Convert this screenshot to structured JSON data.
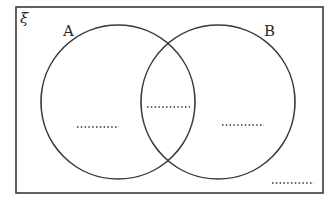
{
  "diagram": {
    "type": "venn",
    "universal_set_symbol": "ξ",
    "sets": [
      {
        "label": "A",
        "cx": 118,
        "cy": 102,
        "r": 77
      },
      {
        "label": "B",
        "cx": 218,
        "cy": 102,
        "r": 77
      }
    ],
    "regions": [
      {
        "name": "only-a",
        "value": "",
        "placeholder": "............",
        "x1": 77,
        "x2": 119,
        "y": 127
      },
      {
        "name": "a-intersect-b",
        "value": "",
        "placeholder": "............",
        "x1": 147,
        "x2": 190,
        "y": 107
      },
      {
        "name": "only-b",
        "value": "",
        "placeholder": "............",
        "x1": 222,
        "x2": 264,
        "y": 125
      },
      {
        "name": "outside",
        "value": "",
        "placeholder": "............",
        "x1": 272,
        "x2": 314,
        "y": 183
      }
    ],
    "colors": {
      "stroke": "#3a3a3a",
      "background": "#ffffff"
    }
  }
}
